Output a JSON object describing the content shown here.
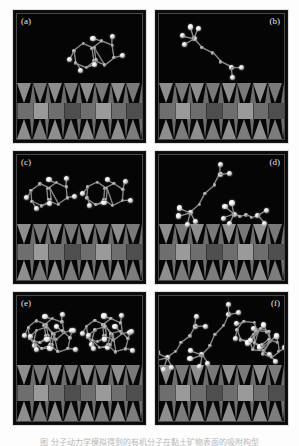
{
  "figure": {
    "kind": "scientific-figure",
    "panel_count": 6,
    "rows": 3,
    "columns": 2,
    "background_color": "#fdfdfd",
    "caption_text": "图  分子动力学模拟得到的有机分子在黏土矿物表面的吸附构型"
  },
  "palette": {
    "panel_background": "#050505",
    "panel_border": "#151515",
    "inner_rule": "#4a4a4a",
    "label_color": "#e8e8e8",
    "tetrahedral_sheet": "#070707",
    "tetrahedra_fill": "#9a9a9a",
    "octahedral_sheet": "#5a5a5a",
    "octahedra_fill": "#6e6e6e",
    "octahedra_highlight": "#9a9a9a",
    "bond_color": "#8f8f8f",
    "hydrogen_atom": "#ffffff",
    "carbon_atom": "#a8a8a8"
  },
  "panels": [
    {
      "id": "a",
      "label": "(a)",
      "label_position": "left",
      "row": 1,
      "column": 1,
      "view": "top-view",
      "molecule_count": 1,
      "description": "single aromatic bicyclic molecule lying flat above clay surface"
    },
    {
      "id": "b",
      "label": "(b)",
      "label_position": "right",
      "row": 1,
      "column": 2,
      "view": "side-view",
      "molecule_count": 1,
      "description": "single molecule viewed edge-on, tilted to the surface"
    },
    {
      "id": "c",
      "label": "(c)",
      "label_position": "left",
      "row": 2,
      "column": 1,
      "view": "top-view",
      "molecule_count": 2,
      "description": "two aromatic molecules side by side above clay surface"
    },
    {
      "id": "d",
      "label": "(d)",
      "label_position": "right",
      "row": 2,
      "column": 2,
      "view": "side-view",
      "molecule_count": 2,
      "description": "two molecules edge-on, one tilted and one nearly parallel"
    },
    {
      "id": "e",
      "label": "(e)",
      "label_position": "left",
      "row": 3,
      "column": 1,
      "view": "top-view",
      "molecule_count": 4,
      "description": "four stacked aromatic molecules forming two clusters"
    },
    {
      "id": "f",
      "label": "(f)",
      "label_position": "right",
      "row": 3,
      "column": 2,
      "view": "side-view",
      "molecule_count": 4,
      "description": "four molecules edge-on at varied tilt angles"
    }
  ],
  "substrate": {
    "name": "layered clay mineral (2:1 phyllosilicate)",
    "layers": [
      {
        "name": "upper tetrahedral sheet",
        "shape": "triangles"
      },
      {
        "name": "octahedral sheet",
        "shape": "squares"
      },
      {
        "name": "lower tetrahedral sheet",
        "shape": "triangles"
      }
    ]
  }
}
